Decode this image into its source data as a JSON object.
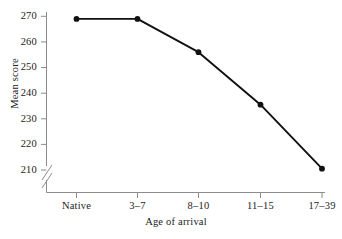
{
  "chart_data": {
    "type": "line",
    "title": "",
    "xlabel": "Age of arrival",
    "ylabel": "Mean score",
    "categories": [
      "Native",
      "3–7",
      "8–10",
      "11–15",
      "17–39"
    ],
    "values": [
      269,
      269,
      256,
      235.5,
      210.5
    ],
    "series": [
      {
        "name": "Mean score",
        "values": [
          269,
          269,
          256,
          235.5,
          210.5
        ]
      }
    ],
    "ytick_labels": [
      "270",
      "260",
      "250",
      "240",
      "230",
      "220",
      "210"
    ],
    "ytick_values": [
      270,
      260,
      250,
      240,
      230,
      220,
      210
    ],
    "ylim": [
      207,
      272
    ],
    "grid": false,
    "legend": "none",
    "axis_break": {
      "axis": "y",
      "style": "double-slash",
      "below_value": 210
    },
    "marker": "filled-circle",
    "colors": {
      "line": "#111111",
      "marker": "#111111",
      "axis": "#8c8c8c",
      "text": "#1b1b1b",
      "background": "#ffffff"
    }
  }
}
